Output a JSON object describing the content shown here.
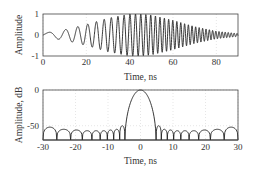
{
  "chart_data": [
    {
      "type": "line",
      "title": "",
      "xlabel": "Time, ns",
      "ylabel": "Amplitude",
      "xlim": [
        0,
        90
      ],
      "ylim": [
        -1,
        1
      ],
      "xticks": [
        0,
        20,
        40,
        60,
        80
      ],
      "yticks": [
        -1,
        0,
        1
      ],
      "xtick_labels": [
        "0",
        "20",
        "40",
        "60",
        "80"
      ],
      "ytick_labels": [
        "-1",
        "0",
        "1"
      ],
      "grid": true,
      "series": [
        {
          "name": "chirp signal",
          "description": "linear-FM chirp, frequency increasing with time, bell-shaped envelope peaking near 40-50 ns",
          "envelope_x": [
            0,
            10,
            20,
            30,
            40,
            45,
            50,
            60,
            70,
            80,
            90
          ],
          "envelope_y": [
            0.08,
            0.25,
            0.5,
            0.8,
            1.0,
            1.0,
            0.95,
            0.7,
            0.4,
            0.18,
            0.07
          ]
        }
      ]
    },
    {
      "type": "line",
      "title": "",
      "xlabel": "Time, ns",
      "ylabel": "Amplitude, dB",
      "xlim": [
        -30,
        30
      ],
      "ylim": [
        -70,
        0
      ],
      "xticks": [
        -30,
        -20,
        -10,
        0,
        10,
        20,
        30
      ],
      "yticks": [
        -50,
        0
      ],
      "xtick_labels": [
        "-30",
        "-20",
        "-10",
        "0",
        "10",
        "20",
        "30"
      ],
      "ytick_labels": [
        "-50",
        "0"
      ],
      "grid": true,
      "series": [
        {
          "name": "compressed pulse",
          "main_lobe": {
            "x": [
              -4.8,
              -3,
              0,
              3,
              4.8
            ],
            "y": [
              -70,
              -25,
              0,
              -25,
              -70
            ]
          },
          "sidelobe_peak_level_db": -50,
          "sidelobe_centers_left": [
            -28,
            -23.5,
            -19.5,
            -16.3,
            -13.6,
            -11.2,
            -9.2,
            -7.3,
            -5.5
          ],
          "sidelobe_centers_right": [
            5.5,
            7.3,
            9.2,
            11.2,
            13.6,
            16.3,
            19.5,
            23.5,
            28
          ],
          "sidelobe_peaks_db": [
            -52,
            -55,
            -56,
            -57,
            -57,
            -57,
            -56,
            -55,
            -50
          ]
        }
      ]
    }
  ],
  "labels": {
    "top_ylabel": "Amplitude",
    "top_xlabel": "Time, ns",
    "bottom_ylabel": "Amplitude, dB",
    "bottom_xlabel": "Time, ns"
  }
}
